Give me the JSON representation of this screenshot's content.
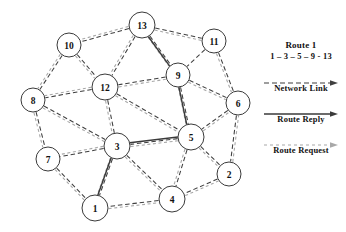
{
  "diagram": {
    "type": "network-graph",
    "width": 346,
    "height": 232,
    "nodes": [
      {
        "id": "13",
        "label": "13",
        "x": 142,
        "y": 25,
        "r": 13
      },
      {
        "id": "11",
        "label": "11",
        "x": 214,
        "y": 41,
        "r": 12
      },
      {
        "id": "10",
        "label": "10",
        "x": 69,
        "y": 45,
        "r": 12
      },
      {
        "id": "9",
        "label": "9",
        "x": 178,
        "y": 75,
        "r": 12
      },
      {
        "id": "12",
        "label": "12",
        "x": 105,
        "y": 87,
        "r": 13
      },
      {
        "id": "8",
        "label": "8",
        "x": 33,
        "y": 100,
        "r": 12
      },
      {
        "id": "6",
        "label": "6",
        "x": 238,
        "y": 103,
        "r": 12
      },
      {
        "id": "5",
        "label": "5",
        "x": 191,
        "y": 137,
        "r": 13
      },
      {
        "id": "3",
        "label": "3",
        "x": 117,
        "y": 146,
        "r": 13
      },
      {
        "id": "7",
        "label": "7",
        "x": 48,
        "y": 159,
        "r": 12
      },
      {
        "id": "2",
        "label": "2",
        "x": 229,
        "y": 174,
        "r": 12
      },
      {
        "id": "4",
        "label": "4",
        "x": 172,
        "y": 199,
        "r": 13
      },
      {
        "id": "1",
        "label": "1",
        "x": 95,
        "y": 208,
        "r": 13
      }
    ],
    "network_links": [
      [
        "13",
        "10"
      ],
      [
        "13",
        "11"
      ],
      [
        "13",
        "12"
      ],
      [
        "13",
        "9"
      ],
      [
        "11",
        "9"
      ],
      [
        "11",
        "6"
      ],
      [
        "10",
        "8"
      ],
      [
        "10",
        "12"
      ],
      [
        "9",
        "12"
      ],
      [
        "9",
        "6"
      ],
      [
        "9",
        "5"
      ],
      [
        "12",
        "8"
      ],
      [
        "12",
        "3"
      ],
      [
        "12",
        "5"
      ],
      [
        "8",
        "7"
      ],
      [
        "8",
        "3"
      ],
      [
        "6",
        "5"
      ],
      [
        "6",
        "2"
      ],
      [
        "5",
        "3"
      ],
      [
        "5",
        "4"
      ],
      [
        "5",
        "2"
      ],
      [
        "3",
        "7"
      ],
      [
        "3",
        "1"
      ],
      [
        "3",
        "4"
      ],
      [
        "7",
        "1"
      ],
      [
        "2",
        "4"
      ],
      [
        "4",
        "1"
      ]
    ],
    "route_request_links": [
      [
        "13",
        "10"
      ],
      [
        "13",
        "12"
      ],
      [
        "13",
        "9"
      ],
      [
        "13",
        "11"
      ],
      [
        "10",
        "8"
      ],
      [
        "10",
        "12"
      ],
      [
        "12",
        "8"
      ],
      [
        "12",
        "3"
      ],
      [
        "12",
        "5"
      ],
      [
        "12",
        "9"
      ],
      [
        "8",
        "7"
      ],
      [
        "8",
        "3"
      ],
      [
        "9",
        "5"
      ],
      [
        "9",
        "6"
      ],
      [
        "11",
        "6"
      ],
      [
        "3",
        "5"
      ],
      [
        "3",
        "1"
      ],
      [
        "3",
        "4"
      ],
      [
        "3",
        "7"
      ],
      [
        "5",
        "4"
      ],
      [
        "5",
        "6"
      ],
      [
        "5",
        "2"
      ],
      [
        "7",
        "1"
      ],
      [
        "1",
        "4"
      ],
      [
        "4",
        "2"
      ],
      [
        "2",
        "6"
      ]
    ],
    "route_reply_path": [
      "1",
      "3",
      "5",
      "9",
      "13"
    ]
  },
  "legend": {
    "title": "Route 1",
    "route_sequence": "1 – 3 – 5 – 9 - 13",
    "entries": [
      {
        "id": "network-link",
        "caption": "Network Link",
        "style": "dashed",
        "color": "#3f3f3f"
      },
      {
        "id": "route-reply",
        "caption": "Route Reply",
        "style": "solid",
        "color": "#3a3a3a"
      },
      {
        "id": "route-request",
        "caption": "Route Request",
        "style": "dotted",
        "color": "#a8a8a8"
      }
    ]
  },
  "colors": {
    "network_link": "#3f3f3f",
    "route_reply": "#3a3a3a",
    "route_request": "#a8a8a8",
    "node_stroke": "#3a3a3a",
    "node_fill": "#ffffff",
    "text": "#111111",
    "background": "#ffffff"
  }
}
